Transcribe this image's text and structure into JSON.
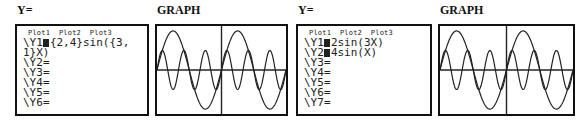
{
  "panels": [
    {
      "label": "Y=",
      "plots": "Plot1  Plot2  Plot3",
      "lines": [
        {
          "prefix": "\\Y1",
          "expr": "{2,4}sin({3,",
          "cursor": true
        },
        {
          "prefix": "",
          "expr": "1}X)",
          "cursor": false
        },
        {
          "prefix": "\\Y2",
          "expr": "=",
          "cursor": false
        },
        {
          "prefix": "\\Y3",
          "expr": "=",
          "cursor": false
        },
        {
          "prefix": "\\Y4",
          "expr": "=",
          "cursor": false
        },
        {
          "prefix": "\\Y5",
          "expr": "=",
          "cursor": false
        },
        {
          "prefix": "\\Y6",
          "expr": "=",
          "cursor": false
        }
      ]
    },
    {
      "label": "GRAPH"
    },
    {
      "label": "Y=",
      "plots": "Plot1  Plot2  Plot3",
      "lines": [
        {
          "prefix": "\\Y1",
          "expr": "2sin(3X)",
          "cursor": true
        },
        {
          "prefix": "\\Y2",
          "expr": "4sin(X)",
          "cursor": true
        },
        {
          "prefix": "\\Y3",
          "expr": "=",
          "cursor": false
        },
        {
          "prefix": "\\Y4",
          "expr": "=",
          "cursor": false
        },
        {
          "prefix": "\\Y5",
          "expr": "=",
          "cursor": false
        },
        {
          "prefix": "\\Y6",
          "expr": "=",
          "cursor": false
        },
        {
          "prefix": "\\Y7",
          "expr": "=",
          "cursor": false
        }
      ]
    },
    {
      "label": "GRAPH"
    }
  ],
  "graph": {
    "functions": [
      "2sin(3X)",
      "4sin(X)"
    ],
    "xrange": [
      -6.28,
      6.28
    ],
    "yrange": [
      -4.5,
      4.5
    ],
    "color": "#222222"
  }
}
